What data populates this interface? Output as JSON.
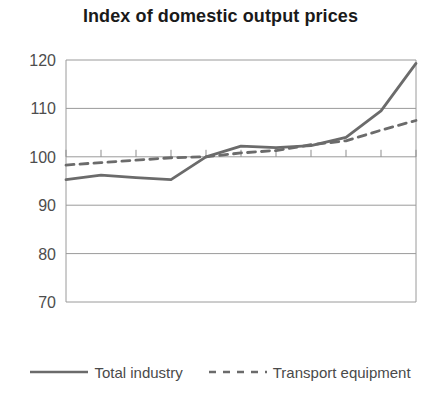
{
  "chart_data": {
    "type": "line",
    "title": "Index of domestic output prices",
    "xlabel": "",
    "ylabel": "",
    "x": [
      1996,
      1997,
      1998,
      1999,
      2000,
      2001,
      2002,
      2003,
      2004,
      2005,
      2006
    ],
    "xtick_labels": [
      "1996",
      "1998",
      "2000",
      "2002",
      "2004",
      "2006"
    ],
    "xtick_values": [
      1996,
      1998,
      2000,
      2002,
      2004,
      2006
    ],
    "xlim": [
      1996,
      2006
    ],
    "ylim": [
      70,
      120
    ],
    "ytick_labels": [
      "70",
      "80",
      "90",
      "100",
      "110",
      "120"
    ],
    "ytick_values": [
      70,
      80,
      90,
      100,
      110,
      120
    ],
    "grid": "horizontal",
    "legend_position": "bottom",
    "series": [
      {
        "name": "Total industry",
        "style": "solid",
        "color": "#6b6b6b",
        "values": [
          95.3,
          96.2,
          95.7,
          95.3,
          100.0,
          102.2,
          101.9,
          102.3,
          104.0,
          109.5,
          119.3
        ]
      },
      {
        "name": "Transport equipment",
        "style": "dashed",
        "color": "#6b6b6b",
        "values": [
          98.3,
          98.8,
          99.3,
          99.8,
          100.0,
          100.8,
          101.3,
          102.5,
          103.3,
          105.5,
          107.5
        ]
      }
    ]
  },
  "legend": {
    "items": [
      {
        "label": "Total industry"
      },
      {
        "label": "Transport equipment"
      }
    ]
  }
}
